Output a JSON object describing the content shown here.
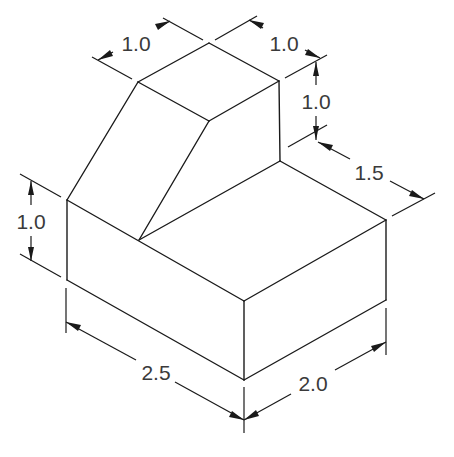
{
  "drawing": {
    "type": "isometric technical drawing",
    "object": "stepped block with inclined face",
    "line_color": "#1a1a1a",
    "text_color": "#3a3a3a",
    "background": "#ffffff"
  },
  "dimensions": {
    "top_left_depth": "1.0",
    "top_right_width": "1.0",
    "upper_height": "1.0",
    "step_depth": "1.5",
    "base_height": "1.0",
    "overall_length": "2.5",
    "overall_width": "2.0"
  }
}
